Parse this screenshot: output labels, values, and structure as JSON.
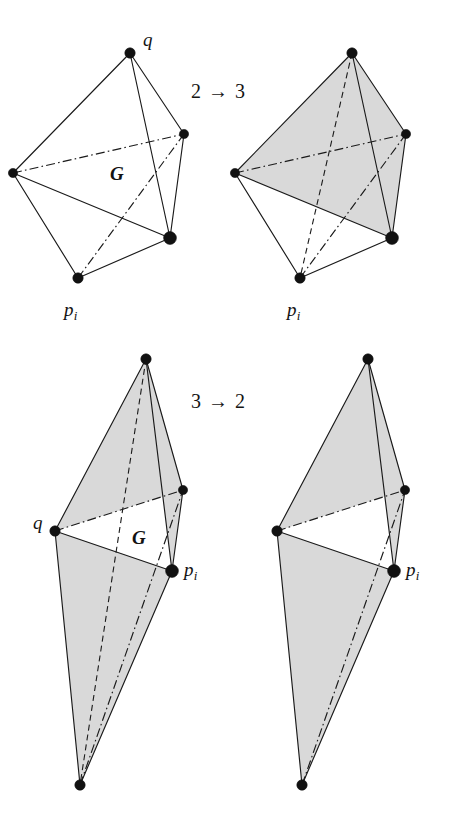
{
  "figure": {
    "background_color": "#ffffff",
    "line_color": "#1a1a1a",
    "shade_color": "#d9d9d9",
    "vertex_color": "#111111",
    "panels": [
      {
        "id": "top-left",
        "name": "two-tetrahedra-configuration",
        "shaded": false,
        "operation_side": "before",
        "labels": [
          {
            "name": "vertex-label-q",
            "text": "q",
            "x": 143,
            "y": 30,
            "kind": "vertex"
          },
          {
            "name": "region-label-G",
            "text": "G",
            "x": 110,
            "y": 164,
            "kind": "region"
          },
          {
            "name": "vertex-label-pi",
            "text": "p",
            "sub": "i",
            "x": 64,
            "y": 300,
            "kind": "vertex"
          }
        ]
      },
      {
        "id": "top-right",
        "name": "three-tetrahedra-configuration",
        "shaded": true,
        "operation_side": "after",
        "labels": [
          {
            "name": "vertex-label-pi",
            "text": "p",
            "sub": "i",
            "x": 287,
            "y": 300,
            "kind": "vertex"
          }
        ]
      },
      {
        "id": "bottom-left",
        "name": "three-tetrahedra-bipyramid",
        "shaded": true,
        "operation_side": "before",
        "labels": [
          {
            "name": "vertex-label-q",
            "text": "q",
            "x": 33,
            "y": 513,
            "kind": "vertex"
          },
          {
            "name": "region-label-G",
            "text": "G",
            "x": 132,
            "y": 528,
            "kind": "region"
          },
          {
            "name": "vertex-label-pi",
            "text": "p",
            "sub": "i",
            "x": 184,
            "y": 560,
            "kind": "vertex"
          }
        ]
      },
      {
        "id": "bottom-right",
        "name": "two-tetrahedra-bipyramid",
        "shaded": true,
        "operation_side": "after",
        "labels": [
          {
            "name": "vertex-label-pi",
            "text": "p",
            "sub": "i",
            "x": 406,
            "y": 560,
            "kind": "vertex"
          }
        ]
      }
    ],
    "operations": [
      {
        "name": "flip-2-to-3-label",
        "text": "2 → 3",
        "x": 191,
        "y": 81
      },
      {
        "name": "flip-3-to-2-label",
        "text": "3 → 2",
        "x": 191,
        "y": 391
      }
    ],
    "geometry": {
      "top_left": {
        "q": [
          130,
          53
        ],
        "left": [
          13,
          173
        ],
        "right": [
          184,
          134
        ],
        "base": [
          170,
          238
        ],
        "pi": [
          78,
          278
        ]
      },
      "top_right": {
        "q": [
          352,
          53
        ],
        "left": [
          235,
          173
        ],
        "right": [
          406,
          134
        ],
        "base": [
          392,
          238
        ],
        "pi": [
          300,
          278
        ]
      },
      "bottom_left": {
        "top": [
          146,
          359
        ],
        "q": [
          55,
          531
        ],
        "right": [
          183,
          490
        ],
        "pi": [
          172,
          571
        ],
        "bottom": [
          80,
          785
        ]
      },
      "bottom_right": {
        "top": [
          368,
          359
        ],
        "q": [
          277,
          531
        ],
        "right": [
          405,
          490
        ],
        "pi": [
          394,
          571
        ],
        "bottom": [
          302,
          785
        ]
      }
    }
  }
}
